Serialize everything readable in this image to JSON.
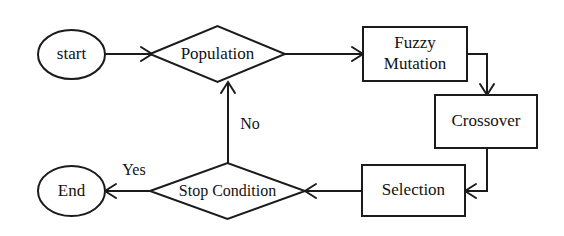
{
  "diagram": {
    "background_color": "#ffffff",
    "line_color": "#1b1b1b",
    "text_color": "#121212",
    "nodes": [
      {
        "id": "start",
        "label": "start",
        "shape": "ellipse"
      },
      {
        "id": "population",
        "label": "Population",
        "shape": "diamond"
      },
      {
        "id": "fuzzy_mutation",
        "label_line1": "Fuzzy",
        "label_line2": "Mutation",
        "label": "Fuzzy Mutation",
        "shape": "rectangle"
      },
      {
        "id": "crossover",
        "label": "Crossover",
        "shape": "rectangle"
      },
      {
        "id": "selection",
        "label": "Selection",
        "shape": "rectangle"
      },
      {
        "id": "stop_condition",
        "label": "Stop Condition",
        "shape": "diamond"
      },
      {
        "id": "end",
        "label": "End",
        "shape": "ellipse"
      }
    ],
    "edges": [
      {
        "id": "start_to_population",
        "from": "start",
        "to": "population",
        "label": ""
      },
      {
        "id": "population_to_fuzzy",
        "from": "population",
        "to": "fuzzy_mutation",
        "label": ""
      },
      {
        "id": "fuzzy_to_crossover",
        "from": "fuzzy_mutation",
        "to": "crossover",
        "label": ""
      },
      {
        "id": "crossover_to_selection",
        "from": "crossover",
        "to": "selection",
        "label": ""
      },
      {
        "id": "selection_to_stop",
        "from": "selection",
        "to": "stop_condition",
        "label": ""
      },
      {
        "id": "stop_to_end",
        "from": "stop_condition",
        "to": "end",
        "label": "Yes"
      },
      {
        "id": "stop_to_population",
        "from": "stop_condition",
        "to": "population",
        "label": "No"
      }
    ]
  }
}
